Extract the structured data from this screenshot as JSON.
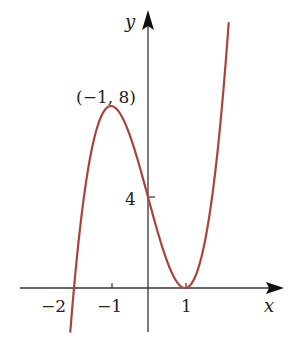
{
  "chart_data": {
    "type": "line",
    "title": "",
    "function": "f(x) = 2(x - 1)^2 (x + 2)",
    "xlabel": "x",
    "ylabel": "y",
    "x_ticks": [
      -2,
      -1,
      1
    ],
    "x_tick_labels": [
      "−2",
      "−1",
      "1"
    ],
    "y_ticks": [
      4
    ],
    "y_tick_labels": [
      "4"
    ],
    "annotations": [
      {
        "text": "(−1, 8)",
        "x": -1,
        "y": 8
      }
    ],
    "key_points": [
      {
        "x": -2,
        "y": 0
      },
      {
        "x": -1,
        "y": 8
      },
      {
        "x": 0,
        "y": 4
      },
      {
        "x": 1,
        "y": 0
      }
    ],
    "xlim": [
      -2.15,
      2.25
    ],
    "ylim": [
      -1.8,
      10
    ],
    "grid": false,
    "legend": null,
    "curve_color": "#a8433e",
    "axis_color": "#333333"
  },
  "labels": {
    "x_axis": "x",
    "y_axis": "y",
    "max_point": "(−1, 8)",
    "y_tick_4": "4",
    "x_tick_neg2": "−2",
    "x_tick_neg1": "−1",
    "x_tick_1": "1"
  }
}
